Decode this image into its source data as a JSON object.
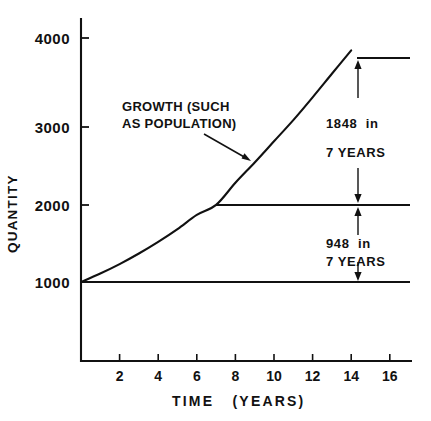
{
  "chart_data": {
    "type": "line",
    "title": "",
    "xlabel": "TIME   (YEARS)",
    "ylabel": "QUANTITY",
    "xlim": [
      0,
      17
    ],
    "ylim": [
      0,
      4400
    ],
    "grid": false,
    "legend_position": "none",
    "x_ticks": [
      2,
      4,
      6,
      8,
      10,
      12,
      14,
      16
    ],
    "x_tick_labels": [
      "2",
      "4",
      "6",
      "8",
      "10",
      "12",
      "14",
      "16"
    ],
    "y_ticks": [
      1000,
      2000,
      3000,
      4000
    ],
    "y_tick_labels": [
      "1000",
      "2000",
      "3000",
      "4000"
    ],
    "series": [
      {
        "name": "GROWTH (SUCH AS POPULATION)",
        "type": "line",
        "x": [
          0,
          1,
          2,
          3,
          4,
          5,
          6,
          7,
          8,
          9,
          10,
          11,
          12,
          13,
          14
        ],
        "values": [
          1000,
          1104,
          1220,
          1350,
          1493,
          1650,
          1824,
          1948,
          2220,
          2470,
          2730,
          2990,
          3270,
          3560,
          3848
        ]
      }
    ],
    "reference_lines": [
      {
        "name": "baseline-1000",
        "y": 1000,
        "x_start": 0,
        "x_end": 17
      },
      {
        "name": "level-1948",
        "y": 1948,
        "x_start": 7,
        "x_end": 17
      },
      {
        "name": "level-3796",
        "y": 3796,
        "x_start": 14,
        "x_end": 17
      }
    ],
    "annotations": [
      {
        "name": "curve-label",
        "line1": "GROWTH (SUCH",
        "line2": "AS POPULATION)"
      },
      {
        "name": "upper-growth",
        "line1": "1848  in",
        "line2": "7 YEARS",
        "value": 1848,
        "period_years": 7
      },
      {
        "name": "lower-growth",
        "line1": "948  in",
        "line2": "7 YEARS",
        "value": 948,
        "period_years": 7
      }
    ],
    "colors": {
      "ink": "#111111",
      "background": "#ffffff"
    }
  },
  "axes": {
    "y_title": "QUANTITY",
    "x_title": "TIME   (YEARS)"
  },
  "ticks": {
    "y": [
      "4000",
      "3000",
      "2000",
      "1000"
    ],
    "x": [
      "2",
      "4",
      "6",
      "8",
      "10",
      "12",
      "14",
      "16"
    ]
  },
  "annotations": {
    "curve_label_line1": "GROWTH (SUCH",
    "curve_label_line2": "AS POPULATION)",
    "upper_line1": "1848  in",
    "upper_line2": "7 YEARS",
    "lower_line1": "948  in",
    "lower_line2": "7 YEARS"
  }
}
